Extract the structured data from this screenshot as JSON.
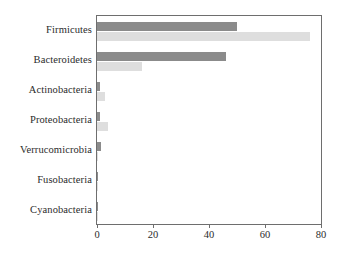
{
  "chart_data": {
    "type": "bar",
    "orientation": "horizontal",
    "title": "",
    "subtitle": "",
    "xlabel": "",
    "ylabel": "",
    "xlim": [
      0,
      80
    ],
    "xticks": [
      0,
      20,
      40,
      60,
      80
    ],
    "xtick_labels": [
      "0",
      "20",
      "40",
      "60",
      "80"
    ],
    "grid": false,
    "legend": false,
    "legend_position": "none",
    "categories": [
      "Firmicutes",
      "Bacteroidetes",
      "Actinobacteria",
      "Proteobacteria",
      "Verrucomicrobia",
      "Fusobacteria",
      "Cyanobacteria"
    ],
    "series": [
      {
        "name": "series-1",
        "color": "#8b8b8b",
        "values": [
          50,
          46,
          1,
          1,
          1.5,
          0.3,
          0.3
        ]
      },
      {
        "name": "series-2",
        "color": "#dedede",
        "values": [
          76,
          16,
          3,
          4,
          0.5,
          0.2,
          0.2
        ]
      }
    ]
  },
  "colors": {
    "series_dark": "#8b8b8b",
    "series_light": "#dedede",
    "axis": "#6e6e6e",
    "text": "#2b2b2b",
    "background": "#ffffff"
  }
}
